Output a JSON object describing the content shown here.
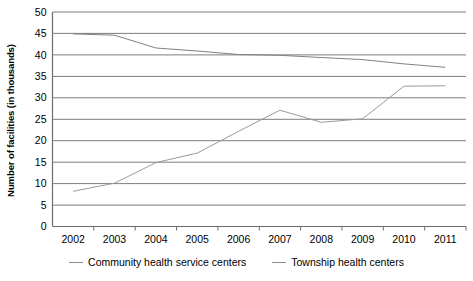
{
  "chart_data": {
    "type": "line",
    "title": "",
    "xlabel": "",
    "ylabel": "Number of facilities (in thousands)",
    "categories": [
      "2002",
      "2003",
      "2004",
      "2005",
      "2006",
      "2007",
      "2008",
      "2009",
      "2010",
      "2011"
    ],
    "ylim": [
      0,
      50
    ],
    "ytick_step": 5,
    "yticks": [
      "0",
      "5",
      "10",
      "15",
      "20",
      "25",
      "30",
      "35",
      "40",
      "45",
      "50"
    ],
    "grid": "horizontal",
    "legend_position": "bottom",
    "series": [
      {
        "name": "Community health service centers",
        "color": "#9a9a9a",
        "values": [
          8.2,
          10.1,
          14.9,
          17.1,
          22.2,
          27.1,
          24.3,
          25.1,
          32.7,
          32.8
        ]
      },
      {
        "name": "Township health centers",
        "color": "#808080",
        "values": [
          44.9,
          44.6,
          41.6,
          40.9,
          40.1,
          39.9,
          39.4,
          38.9,
          37.9,
          37.1
        ]
      }
    ]
  },
  "legend": {
    "items": [
      {
        "label": "Community health service centers"
      },
      {
        "label": "Township health centers"
      }
    ]
  },
  "caption": {
    "clipped_text": ""
  }
}
